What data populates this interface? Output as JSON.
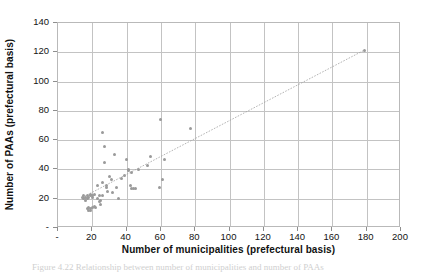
{
  "figure": {
    "caption": "Figure 4.22 Relationship between number of municipalities and number of PAAs"
  },
  "chart_data": {
    "type": "scatter",
    "title": "",
    "xlabel": "Number of municipalities (prefectural basis)",
    "ylabel": "Number of PAAs (prefectural basis)",
    "xlim": [
      0,
      200
    ],
    "ylim": [
      0,
      140
    ],
    "xticks": [
      0,
      20,
      40,
      60,
      80,
      100,
      120,
      140,
      160,
      180,
      200
    ],
    "xtick_labels": [
      "-",
      "20",
      "40",
      "60",
      "80",
      "100",
      "120",
      "140",
      "160",
      "180",
      "200"
    ],
    "yticks": [
      0,
      20,
      40,
      60,
      80,
      100,
      120,
      140
    ],
    "ytick_labels": [
      "-",
      "20",
      "40",
      "60",
      "80",
      "100",
      "120",
      "140"
    ],
    "grid": true,
    "legend": "none",
    "marker_color": "#9a9a9a",
    "trendline_color": "#a0a0a0",
    "series": [
      {
        "name": "Prefectures",
        "points": [
          [
            14,
            21
          ],
          [
            15,
            20
          ],
          [
            15,
            22
          ],
          [
            16,
            21
          ],
          [
            16,
            19
          ],
          [
            17,
            20
          ],
          [
            17,
            22
          ],
          [
            17,
            13
          ],
          [
            18,
            12
          ],
          [
            18,
            14
          ],
          [
            18,
            21
          ],
          [
            19,
            22
          ],
          [
            19,
            23
          ],
          [
            19,
            12
          ],
          [
            19,
            13
          ],
          [
            20,
            22
          ],
          [
            20,
            21
          ],
          [
            20,
            14
          ],
          [
            21,
            15
          ],
          [
            21,
            23
          ],
          [
            22,
            14
          ],
          [
            23,
            29
          ],
          [
            23,
            20
          ],
          [
            24,
            18
          ],
          [
            24,
            22
          ],
          [
            25,
            19
          ],
          [
            25,
            16
          ],
          [
            26,
            65
          ],
          [
            26,
            31
          ],
          [
            26,
            22
          ],
          [
            27,
            56
          ],
          [
            27,
            45
          ],
          [
            28,
            28
          ],
          [
            28,
            29
          ],
          [
            29,
            25
          ],
          [
            30,
            35
          ],
          [
            31,
            33
          ],
          [
            32,
            24
          ],
          [
            33,
            50
          ],
          [
            34,
            28
          ],
          [
            35,
            20
          ],
          [
            37,
            34
          ],
          [
            39,
            36
          ],
          [
            40,
            47
          ],
          [
            41,
            40
          ],
          [
            41,
            39
          ],
          [
            42,
            29
          ],
          [
            43,
            38
          ],
          [
            43,
            27
          ],
          [
            44,
            27
          ],
          [
            45,
            27
          ],
          [
            47,
            40
          ],
          [
            52,
            43
          ],
          [
            54,
            49
          ],
          [
            59,
            28
          ],
          [
            60,
            74
          ],
          [
            61,
            33
          ],
          [
            62,
            47
          ],
          [
            77,
            68
          ],
          [
            179,
            121
          ]
        ]
      }
    ],
    "trendline": {
      "x": [
        14,
        180
      ],
      "y": [
        19.5,
        121.5
      ]
    }
  }
}
